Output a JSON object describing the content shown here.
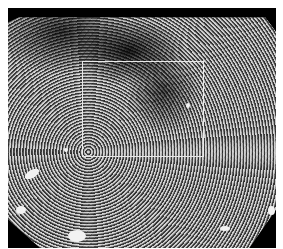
{
  "image": {
    "description": "grayscale magnified endoscopic view of mucosal surface pattern",
    "background_color": "#000000"
  },
  "annotation": {
    "type": "rectangle",
    "color": "#e8e8e8",
    "box": {
      "x": 82,
      "y": 61,
      "width": 122,
      "height": 96
    }
  }
}
